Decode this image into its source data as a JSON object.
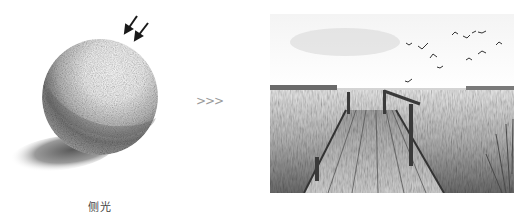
{
  "figure": {
    "left_illustration": {
      "subject": "pencil-sketched sphere under side lighting",
      "caption": "侧光",
      "light_arrows": 2
    },
    "transition_glyph": ">>>",
    "right_illustration": {
      "subject": "pencil sketch of wooden pier extending into a lake with flying birds"
    },
    "colors": {
      "background": "#ffffff",
      "pencil_dark": "#2a2a2a",
      "pencil_mid": "#8c8c8c",
      "pencil_light": "#d6d6d6",
      "caption_text": "#444444",
      "chevron": "#9a9a9a"
    }
  }
}
